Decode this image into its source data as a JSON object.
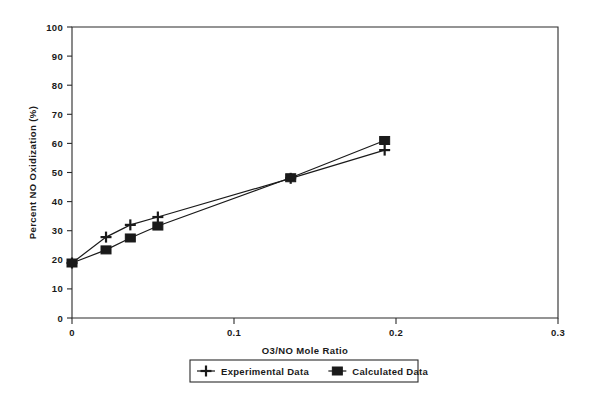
{
  "chart_data": {
    "type": "line",
    "title": "",
    "xlabel": "O3/NO Mole Ratio",
    "ylabel": "Percent NO Oxidization (%)",
    "xlim": [
      0,
      0.3
    ],
    "ylim": [
      0,
      100
    ],
    "xticks": [
      0,
      0.1,
      0.2,
      0.3
    ],
    "xtick_labels": [
      "0",
      "0.1",
      "0.2",
      "0.3"
    ],
    "yticks": [
      0,
      10,
      20,
      30,
      40,
      50,
      60,
      70,
      80,
      90,
      100
    ],
    "ytick_labels": [
      "0",
      "10",
      "20",
      "30",
      "40",
      "50",
      "60",
      "70",
      "80",
      "90",
      "100"
    ],
    "grid": false,
    "legend_position": "below-center",
    "series": [
      {
        "name": "Experimental Data",
        "marker": "plus",
        "x": [
          0.0,
          0.021,
          0.036,
          0.053,
          0.135,
          0.193
        ],
        "values": [
          18.9,
          27.8,
          32.0,
          34.7,
          48.0,
          57.7
        ]
      },
      {
        "name": "Calculated Data",
        "marker": "square",
        "x": [
          0.0,
          0.021,
          0.036,
          0.053,
          0.135,
          0.193
        ],
        "values": [
          18.9,
          23.4,
          27.5,
          31.6,
          48.2,
          61.0
        ]
      }
    ],
    "colors": {
      "line": "#1a1a1a",
      "axis": "#2b2b2b",
      "background": "#ffffff"
    }
  },
  "legend": {
    "entries": [
      {
        "label": "Experimental Data",
        "marker": "plus-marker"
      },
      {
        "label": "Calculated Data",
        "marker": "square-marker"
      }
    ]
  }
}
